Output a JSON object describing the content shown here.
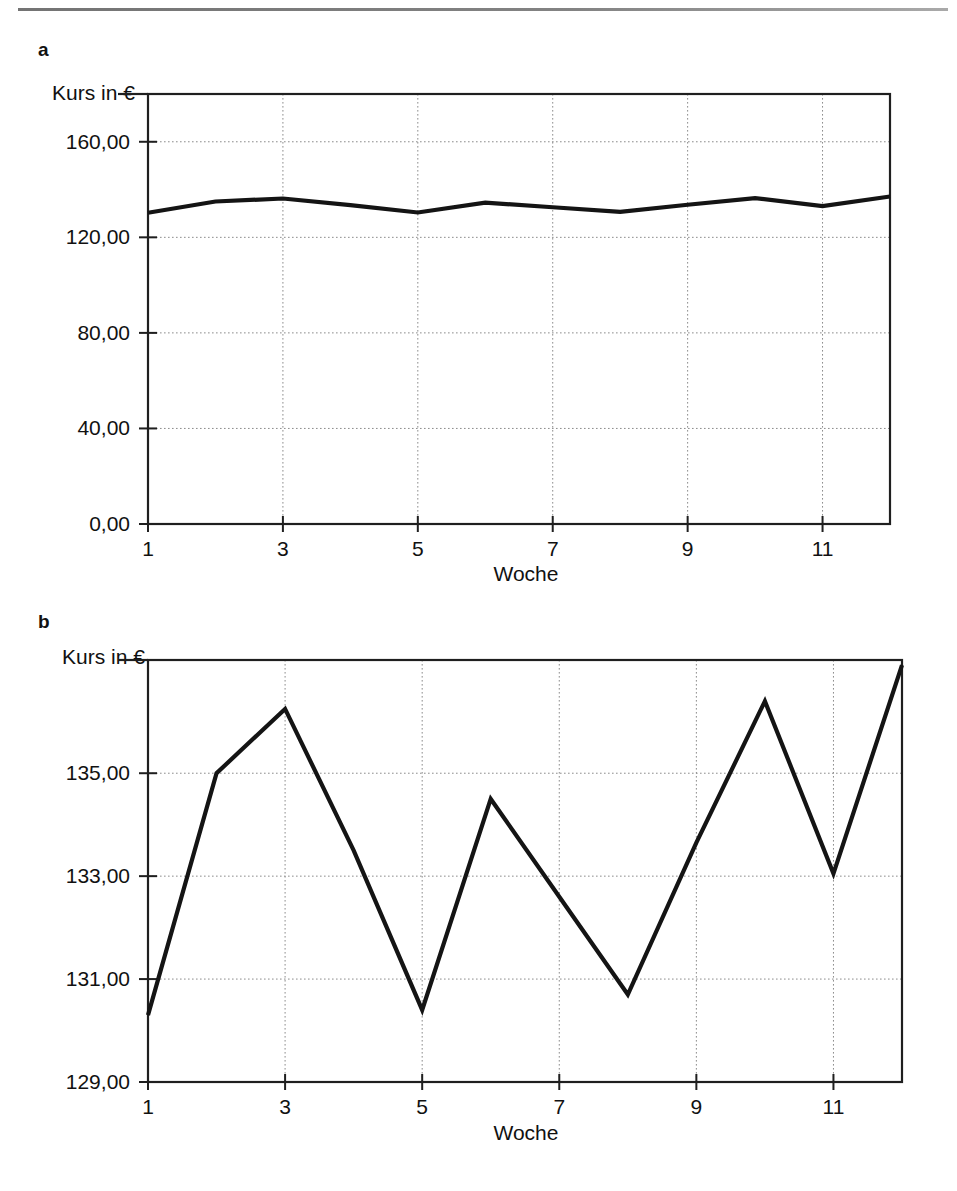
{
  "page": {
    "top_rule": "horizontal-rule"
  },
  "figures": [
    {
      "letter": "a",
      "y_axis_title": "Kurs in €",
      "x_axis_title": "Woche",
      "y_ticks": [
        "0,00",
        "40,00",
        "80,00",
        "120,00",
        "160,00"
      ],
      "x_ticks": [
        "1",
        "3",
        "5",
        "7",
        "9",
        "11"
      ]
    },
    {
      "letter": "b",
      "y_axis_title": "Kurs in €",
      "x_axis_title": "Woche",
      "y_ticks": [
        "129,00",
        "131,00",
        "133,00",
        "135,00"
      ],
      "x_ticks": [
        "1",
        "3",
        "5",
        "7",
        "9",
        "11"
      ]
    }
  ],
  "chart_data": [
    {
      "type": "line",
      "panel": "a",
      "title": "",
      "xlabel": "Woche",
      "ylabel": "Kurs in €",
      "x": [
        1,
        2,
        3,
        4,
        5,
        6,
        7,
        8,
        9,
        10,
        11,
        12
      ],
      "values": [
        130.3,
        135.0,
        136.25,
        133.5,
        130.4,
        134.5,
        132.6,
        130.7,
        133.65,
        136.4,
        133.05,
        137.1
      ],
      "xlim": [
        1,
        12
      ],
      "ylim": [
        0,
        180
      ],
      "y_ticks": [
        0,
        40,
        80,
        120,
        160
      ],
      "y_ticklabels": [
        "0,00",
        "40,00",
        "80,00",
        "120,00",
        "160,00"
      ],
      "x_ticks": [
        1,
        3,
        5,
        7,
        9,
        11
      ],
      "x_ticklabels": [
        "1",
        "3",
        "5",
        "7",
        "9",
        "11"
      ],
      "grid": true,
      "legend": "none",
      "series_color": "#141414"
    },
    {
      "type": "line",
      "panel": "b",
      "title": "",
      "xlabel": "Woche",
      "ylabel": "Kurs in €",
      "x": [
        1,
        2,
        3,
        4,
        5,
        6,
        7,
        8,
        9,
        10,
        11,
        12
      ],
      "values": [
        130.3,
        135.0,
        136.25,
        133.5,
        130.4,
        134.5,
        132.6,
        130.7,
        133.65,
        136.4,
        133.05,
        137.1
      ],
      "xlim": [
        1,
        12
      ],
      "ylim": [
        129,
        137.2
      ],
      "y_ticks": [
        129,
        131,
        133,
        135
      ],
      "y_ticklabels": [
        "129,00",
        "131,00",
        "133,00",
        "135,00"
      ],
      "x_ticks": [
        1,
        3,
        5,
        7,
        9,
        11
      ],
      "x_ticklabels": [
        "1",
        "3",
        "5",
        "7",
        "9",
        "11"
      ],
      "grid": true,
      "legend": "none",
      "series_color": "#141414"
    }
  ]
}
